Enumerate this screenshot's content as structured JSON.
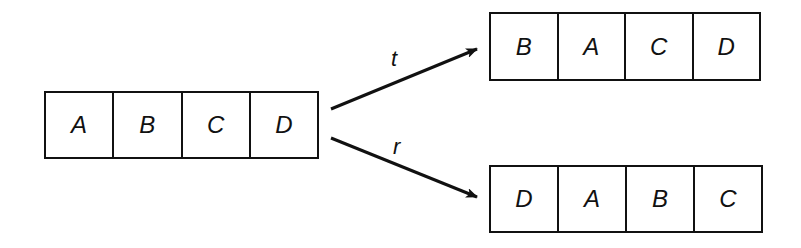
{
  "source": {
    "cells": [
      "A",
      "B",
      "C",
      "D"
    ]
  },
  "transforms": [
    {
      "label": "t",
      "result": [
        "B",
        "A",
        "C",
        "D"
      ]
    },
    {
      "label": "r",
      "result": [
        "D",
        "A",
        "B",
        "C"
      ]
    }
  ],
  "colors": {
    "stroke": "#111111",
    "background": "#ffffff"
  }
}
